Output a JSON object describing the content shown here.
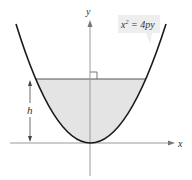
{
  "diagram": {
    "equation_label": "x² = 4py",
    "equation_parts": {
      "base": "x",
      "exp": "2",
      "rhs": " = 4py"
    },
    "axis_x_label": "x",
    "axis_y_label": "y",
    "height_label": "h",
    "colors": {
      "curve": "#1a1a1a",
      "fill": "#e4e4e4",
      "axis": "#9a9a9a",
      "label_box": "#eeeeee"
    }
  }
}
